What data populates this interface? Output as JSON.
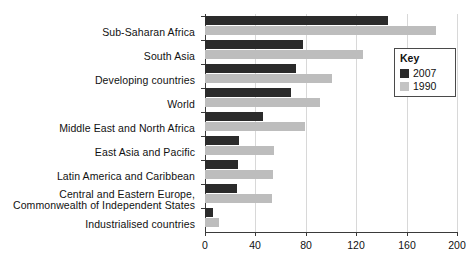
{
  "chart_data": {
    "type": "bar",
    "orientation": "horizontal",
    "title": "",
    "xlabel": "",
    "ylabel": "",
    "xlim": [
      0,
      200
    ],
    "xticks": [
      0,
      40,
      80,
      120,
      160,
      200
    ],
    "xtick_labels": [
      "0",
      "40",
      "80",
      "120",
      "160",
      "200"
    ],
    "grid": true,
    "grid_axis": "x",
    "legend": {
      "title": "Key",
      "position": "top-right-inside",
      "entries": [
        {
          "name": "2007",
          "color": "#2b2b2b"
        },
        {
          "name": "1990",
          "color": "#c4c4c4"
        }
      ]
    },
    "categories": [
      "Sub-Saharan Africa",
      "South Asia",
      "Developing countries",
      "World",
      "Middle East and North Africa",
      "East Asia and Pacific",
      "Latin America and Caribbean",
      "Central and Eastern Europe,\nCommonwealth of Independent States",
      "Industrialised countries"
    ],
    "series": [
      {
        "name": "2007",
        "color": "#2b2b2b",
        "values": [
          145,
          78,
          72,
          68,
          46,
          27,
          26,
          25,
          6
        ]
      },
      {
        "name": "1990",
        "color": "#bdbdbd",
        "values": [
          183,
          125,
          101,
          91,
          79,
          55,
          54,
          53,
          11
        ]
      }
    ]
  },
  "axis": {
    "tick_labels": [
      "0",
      "40",
      "80",
      "120",
      "160",
      "200"
    ]
  },
  "categories": {
    "c0": "Sub-Saharan Africa",
    "c1": "South Asia",
    "c2": "Developing countries",
    "c3": "World",
    "c4": "Middle East and North Africa",
    "c5": "East Asia and Pacific",
    "c6": "Latin America and Caribbean",
    "c7_line1": "Central and Eastern Europe,",
    "c7_line2": "Commonwealth of Independent States",
    "c8": "Industrialised countries"
  },
  "legend": {
    "title": "Key",
    "item_2007": "2007",
    "item_1990": "1990"
  }
}
